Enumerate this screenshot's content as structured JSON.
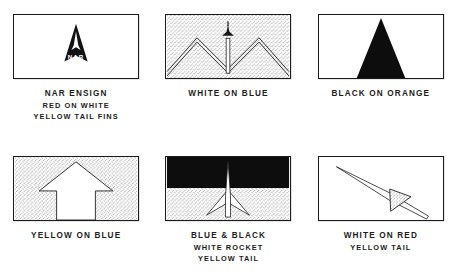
{
  "page": {
    "background_color": "#ffffff",
    "ink_color": "#1a1a1a",
    "sheet_layout": "2 rows x 3 columns of flag illustrations with hand-lettered captions"
  },
  "flags": [
    {
      "id": "nar-ensign",
      "emblem": "black delta arrowhead containing a white rocket above the white letters NAR",
      "emblem_text": "NAR",
      "field": "white",
      "caption_lines": [
        "NAR ENSIGN",
        "RED ON WHITE",
        "YELLOW TAIL FINS"
      ]
    },
    {
      "id": "white-on-blue-peaks",
      "emblem": "white zigzag mountain peaks with a vertical white rocket on a launch pole in the centre valley",
      "emblem_text": "",
      "field": "stippled blue",
      "caption_lines": [
        "WHITE ON BLUE"
      ]
    },
    {
      "id": "black-on-orange-triangle",
      "emblem": "solid black tall isoceles triangle rising from the bottom edge",
      "emblem_text": "",
      "field": "orange",
      "caption_lines": [
        "BLACK ON ORANGE"
      ]
    },
    {
      "id": "yellow-on-blue-arrow",
      "emblem": "large upward pointing arrow outline reaching the bottom edge",
      "emblem_text": "",
      "field": "stippled blue",
      "caption_lines": [
        "YELLOW ON BLUE"
      ]
    },
    {
      "id": "blue-black-white-rocket",
      "emblem": "slender white rocket with swept back fins crossing a black upper half and a stippled lower half",
      "emblem_text": "",
      "field": "black over stippled blue",
      "caption_lines": [
        "BLUE & BLACK",
        "WHITE ROCKET",
        "YELLOW TAIL"
      ]
    },
    {
      "id": "white-on-red-dart",
      "emblem": "long slender dart angled up to the left with a stippled triangular tail fin",
      "emblem_text": "",
      "field": "red",
      "caption_lines": [
        "WHITE ON RED",
        "YELLOW TAIL"
      ]
    }
  ]
}
